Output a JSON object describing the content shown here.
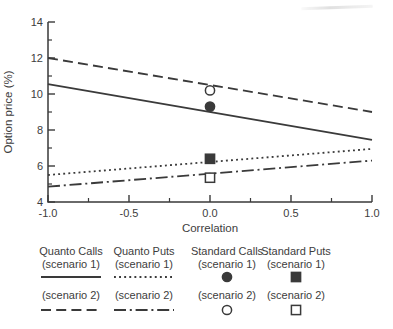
{
  "figure": {
    "bg": "#ffffff",
    "ink": "#3a3a3a",
    "text_color": "#3d3d3d"
  },
  "chart_data": {
    "type": "line",
    "title": "",
    "xlabel": "Correlation",
    "ylabel": "Option price (%)",
    "xlim": [
      -1.0,
      1.0
    ],
    "ylim": [
      4,
      14
    ],
    "grid": false,
    "legend_position": "below",
    "x_major_ticks": [
      -1.0,
      -0.5,
      0.0,
      0.5,
      1.0
    ],
    "x_tick_labels": [
      "-1.0",
      "-0.5",
      "0.0",
      "0.5",
      "1.0"
    ],
    "x_minor_ticks": [
      -0.75,
      -0.25,
      0.25,
      0.75
    ],
    "y_major_ticks": [
      4,
      6,
      8,
      10,
      12,
      14
    ],
    "y_tick_labels": [
      "4",
      "6",
      "8",
      "10",
      "12",
      "14"
    ],
    "y_minor_ticks": [
      5,
      7,
      9,
      11,
      13
    ],
    "series": [
      {
        "name": "Quanto Calls (scenario 1)",
        "style": "solid",
        "x": [
          -1.0,
          1.0
        ],
        "y": [
          10.55,
          7.45
        ]
      },
      {
        "name": "Quanto Calls (scenario 2)",
        "style": "dashed",
        "x": [
          -1.0,
          1.0
        ],
        "y": [
          12.0,
          9.0
        ]
      },
      {
        "name": "Quanto Puts (scenario 1)",
        "style": "dotted",
        "x": [
          -1.0,
          1.0
        ],
        "y": [
          5.5,
          6.95
        ]
      },
      {
        "name": "Quanto Puts (scenario 2)",
        "style": "dashdot",
        "x": [
          -1.0,
          1.0
        ],
        "y": [
          4.85,
          6.3
        ]
      }
    ],
    "points": [
      {
        "name": "Standard Calls (scenario 1)",
        "marker": "filled-circle",
        "x": 0.0,
        "y": 9.3
      },
      {
        "name": "Standard Calls (scenario 2)",
        "marker": "open-circle",
        "x": 0.0,
        "y": 10.2
      },
      {
        "name": "Standard Puts (scenario 1)",
        "marker": "filled-square",
        "x": 0.0,
        "y": 6.4
      },
      {
        "name": "Standard Puts (scenario 2)",
        "marker": "open-square",
        "x": 0.0,
        "y": 5.35
      }
    ]
  },
  "legend": {
    "columns": [
      {
        "title": "Quanto Calls",
        "scenario1": {
          "label": "(scenario 1)",
          "sample": "line-solid"
        },
        "scenario2": {
          "label": "(scenario 2)",
          "sample": "line-dashed"
        }
      },
      {
        "title": "Quanto Puts",
        "scenario1": {
          "label": "(scenario 1)",
          "sample": "line-dotted"
        },
        "scenario2": {
          "label": "(scenario 2)",
          "sample": "line-dashdot"
        }
      },
      {
        "title": "Standard Calls",
        "scenario1": {
          "label": "(scenario 1)",
          "sample": "marker-filled-circle"
        },
        "scenario2": {
          "label": "(scenario 2)",
          "sample": "marker-open-circle"
        }
      },
      {
        "title": "Standard Puts",
        "scenario1": {
          "label": "(scenario 1)",
          "sample": "marker-filled-square"
        },
        "scenario2": {
          "label": "(scenario 2)",
          "sample": "marker-open-square"
        }
      }
    ]
  }
}
